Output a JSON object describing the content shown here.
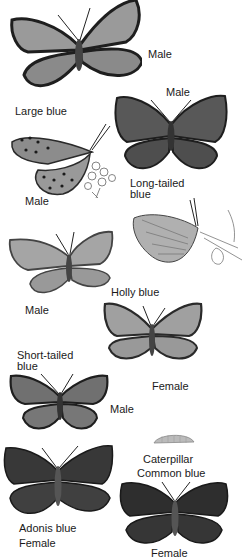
{
  "plate": {
    "labels": {
      "large_blue_male_top": "Male",
      "long_tailed_male": "Male",
      "large_blue": "Large blue",
      "large_blue_male_side": "Male",
      "long_tailed_blue_1": "Long-tailed",
      "long_tailed_blue_2": "blue",
      "holly_blue": "Holly blue",
      "holly_male": "Male",
      "short_tailed_1": "Short-tailed",
      "short_tailed_2": "blue",
      "holly_female": "Female",
      "short_tailed_male": "Male",
      "caterpillar": "Caterpillar",
      "common_blue": "Common blue",
      "adonis_blue": "Adonis blue",
      "adonis_female": "Female",
      "common_female": "Female"
    }
  },
  "colors": {
    "wing_light": "#9a9a9a",
    "wing_mid": "#6e6e6e",
    "wing_dark": "#3a3a3a",
    "outline": "#1e1e1e"
  }
}
